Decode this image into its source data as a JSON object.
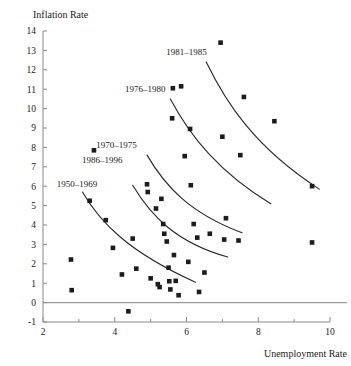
{
  "chart_data": {
    "type": "scatter",
    "title": "",
    "xlabel": "Unemployment Rate",
    "ylabel": "Inflation Rate",
    "xlim": [
      2,
      10
    ],
    "ylim": [
      -1,
      14
    ],
    "xticks": [
      2,
      4,
      6,
      8,
      10
    ],
    "xticks_minor": [
      3,
      5,
      7,
      9
    ],
    "yticks": [
      -1,
      0,
      1,
      2,
      3,
      4,
      5,
      6,
      7,
      8,
      9,
      10,
      11,
      12,
      13,
      14
    ],
    "grid": false,
    "legend": "inline-annotations",
    "annotations": [
      {
        "text": "1981–1985",
        "x": 6.0,
        "y": 12.75
      },
      {
        "text": "1976–1980",
        "x": 4.85,
        "y": 10.85
      },
      {
        "text": "1970–1975",
        "x": 4.05,
        "y": 7.95
      },
      {
        "text": "1986–1996",
        "x": 3.65,
        "y": 7.2
      },
      {
        "text": "1950–1969",
        "x": 2.95,
        "y": 5.95
      }
    ],
    "curves": [
      {
        "name": "1981–1985",
        "path": "M 6.55,12.4 C 7.1,10.3 7.9,8.0 9.7,5.85"
      },
      {
        "name": "1976–1980",
        "path": "M 5.55,10.5 C 6.1,8.6 6.9,6.7 8.35,5.1"
      },
      {
        "name": "1970–1975",
        "path": "M 4.9,7.6 C 5.4,6.0 6.1,4.6 7.55,3.6"
      },
      {
        "name": "1986–1996",
        "path": "M 4.5,6.05 C 5.0,4.5 5.7,3.1 7.15,2.35"
      },
      {
        "name": "1950–1969",
        "path": "M 3.1,5.7 C 3.6,4.1 4.4,2.6 6.25,1.05"
      }
    ],
    "points": [
      {
        "x": 2.78,
        "y": 2.22
      },
      {
        "x": 2.8,
        "y": 0.64
      },
      {
        "x": 3.3,
        "y": 5.25
      },
      {
        "x": 3.42,
        "y": 7.85
      },
      {
        "x": 3.75,
        "y": 4.25
      },
      {
        "x": 3.95,
        "y": 2.82
      },
      {
        "x": 4.2,
        "y": 1.45
      },
      {
        "x": 4.38,
        "y": -0.45
      },
      {
        "x": 4.5,
        "y": 3.3
      },
      {
        "x": 4.6,
        "y": 1.75
      },
      {
        "x": 4.9,
        "y": 6.1
      },
      {
        "x": 4.92,
        "y": 5.7
      },
      {
        "x": 5.0,
        "y": 1.25
      },
      {
        "x": 5.15,
        "y": 4.85
      },
      {
        "x": 5.2,
        "y": 0.95
      },
      {
        "x": 5.25,
        "y": 0.8
      },
      {
        "x": 5.3,
        "y": 5.35
      },
      {
        "x": 5.35,
        "y": 4.05
      },
      {
        "x": 5.38,
        "y": 3.55
      },
      {
        "x": 5.45,
        "y": 3.15
      },
      {
        "x": 5.5,
        "y": 1.8
      },
      {
        "x": 5.52,
        "y": 1.1
      },
      {
        "x": 5.55,
        "y": 0.68
      },
      {
        "x": 5.6,
        "y": 9.5
      },
      {
        "x": 5.62,
        "y": 11.05
      },
      {
        "x": 5.65,
        "y": 2.45
      },
      {
        "x": 5.7,
        "y": 1.12
      },
      {
        "x": 5.78,
        "y": 0.38
      },
      {
        "x": 5.85,
        "y": 11.15
      },
      {
        "x": 5.95,
        "y": 7.55
      },
      {
        "x": 6.05,
        "y": 2.1
      },
      {
        "x": 6.1,
        "y": 8.95
      },
      {
        "x": 6.12,
        "y": 6.05
      },
      {
        "x": 6.2,
        "y": 4.05
      },
      {
        "x": 6.3,
        "y": 3.35
      },
      {
        "x": 6.35,
        "y": 0.55
      },
      {
        "x": 6.5,
        "y": 1.55
      },
      {
        "x": 6.65,
        "y": 3.55
      },
      {
        "x": 6.95,
        "y": 13.4
      },
      {
        "x": 7.0,
        "y": 8.55
      },
      {
        "x": 7.05,
        "y": 3.25
      },
      {
        "x": 7.1,
        "y": 4.35
      },
      {
        "x": 7.45,
        "y": 3.2
      },
      {
        "x": 7.5,
        "y": 7.6
      },
      {
        "x": 7.6,
        "y": 10.6
      },
      {
        "x": 8.45,
        "y": 9.35
      },
      {
        "x": 9.5,
        "y": 6.0
      },
      {
        "x": 9.5,
        "y": 3.1
      }
    ]
  }
}
